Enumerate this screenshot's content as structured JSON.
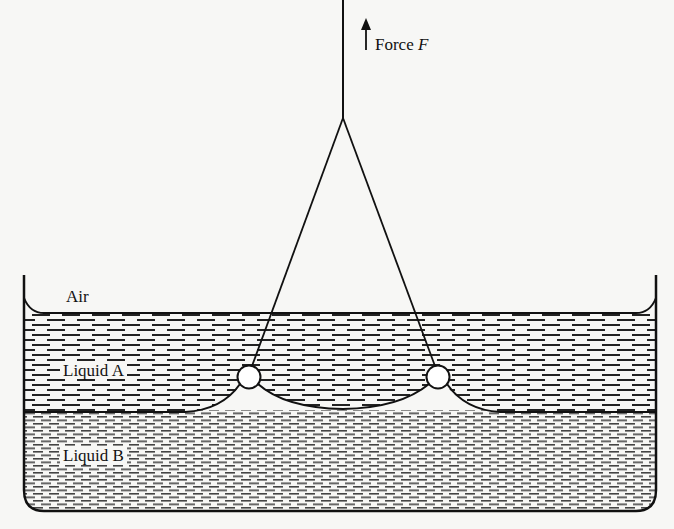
{
  "diagram": {
    "labels": {
      "force": "Force",
      "force_symbol": "F",
      "air": "Air",
      "liquid_a": "Liquid A",
      "liquid_b": "Liquid B"
    },
    "colors": {
      "ink": "#111111",
      "paper": "#f7f7f5"
    }
  }
}
